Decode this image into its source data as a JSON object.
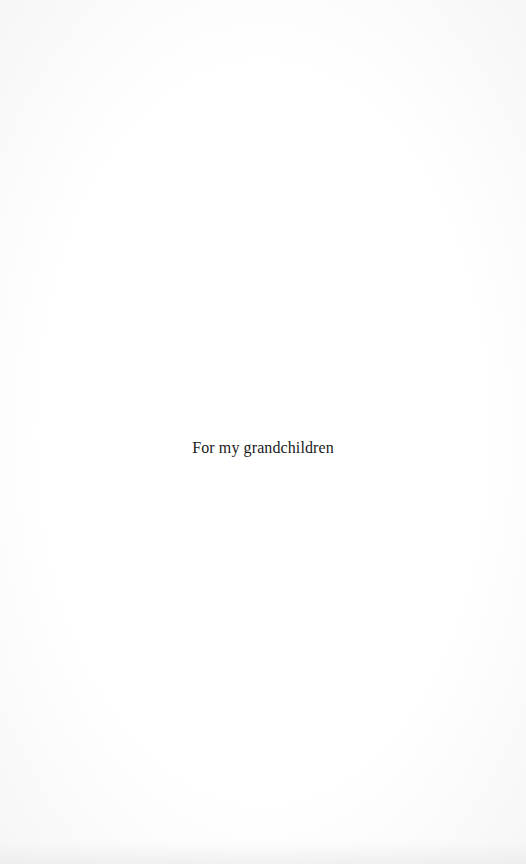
{
  "page": {
    "type": "dedication",
    "text": "For my grandchildren"
  }
}
